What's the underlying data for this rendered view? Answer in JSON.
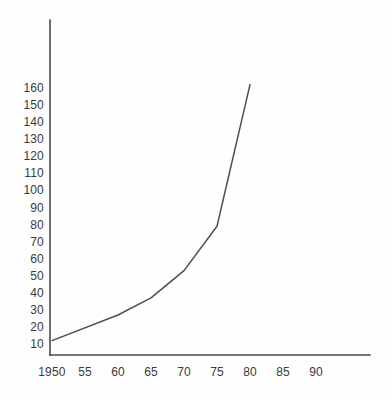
{
  "chart_data": {
    "type": "line",
    "title": "",
    "subtitle": "",
    "xlabel": "",
    "ylabel": "",
    "x": [
      1950,
      1960,
      1965,
      1970,
      1975,
      1980
    ],
    "values": [
      12,
      27,
      37,
      53,
      79,
      162
    ],
    "series": [
      {
        "name": "",
        "x": [
          1950,
          1960,
          1965,
          1970,
          1975,
          1980
        ],
        "values": [
          12,
          27,
          37,
          53,
          79,
          162
        ]
      }
    ],
    "x_tick_labels": [
      "1950",
      "55",
      "60",
      "65",
      "70",
      "75",
      "80",
      "85",
      "90"
    ],
    "x_tick_values": [
      1950,
      1955,
      1960,
      1965,
      1970,
      1975,
      1980,
      1985,
      1990
    ],
    "y_tick_labels": [
      "160",
      "150",
      "140",
      "130",
      "120",
      "110",
      "100",
      "90",
      "80",
      "70",
      "60",
      "50",
      "40",
      "30",
      "20",
      "10"
    ],
    "y_tick_values": [
      160,
      150,
      140,
      130,
      120,
      110,
      100,
      90,
      80,
      70,
      60,
      50,
      40,
      30,
      20,
      10
    ],
    "xlim": [
      1950,
      1993
    ],
    "ylim": [
      4,
      180
    ],
    "grid": false,
    "legend": false,
    "legend_position": "none",
    "annotations": [],
    "line_color": "#4e4e4e",
    "axis_color": "#4a4a4a",
    "background_color": "#fefefe",
    "text_color": "#3a3a3a"
  }
}
